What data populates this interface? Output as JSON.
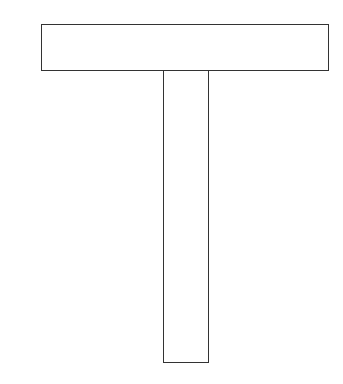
{
  "diagram": {
    "title": "",
    "shapes": [
      {
        "id": "top-bar",
        "type": "rectangle",
        "x": 41,
        "y": 24,
        "width": 288,
        "height": 47,
        "stroke": "#333333",
        "fill": "#ffffff"
      },
      {
        "id": "stem",
        "type": "rectangle",
        "x": 163,
        "y": 70,
        "width": 46,
        "height": 293,
        "stroke": "#333333",
        "fill": "#ffffff"
      }
    ],
    "colors": {
      "stroke": "#333333",
      "background": "#ffffff"
    }
  }
}
